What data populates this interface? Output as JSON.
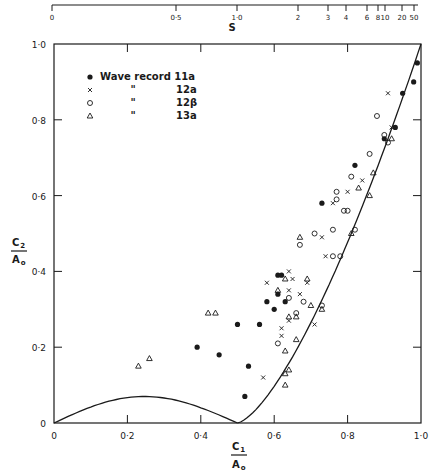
{
  "chart_data": {
    "type": "scatter",
    "title": "",
    "xlabel": "C1 / A0",
    "ylabel": "C2 / A0",
    "xlim": [
      0,
      1.0
    ],
    "ylim": [
      0,
      1.0
    ],
    "grid": false,
    "legend_position": "upper-left",
    "x_ticks": [
      "0",
      "0·2",
      "0·4",
      "0·6",
      "0·8",
      "1·0"
    ],
    "y_ticks": [
      "0",
      "0·2",
      "0·4",
      "0·6",
      "0·8",
      "1·0"
    ],
    "top_axis": {
      "label": "S",
      "ticks": [
        "0",
        "0·5",
        "1·0",
        "2",
        "3",
        "4",
        "6",
        "8",
        "10",
        "20",
        "50"
      ]
    },
    "series": [
      {
        "name": "Wave record 11a",
        "marker": "filled-circle",
        "points": [
          [
            0.39,
            0.2
          ],
          [
            0.45,
            0.18
          ],
          [
            0.5,
            0.26
          ],
          [
            0.56,
            0.26
          ],
          [
            0.53,
            0.15
          ],
          [
            0.52,
            0.07
          ],
          [
            0.58,
            0.32
          ],
          [
            0.63,
            0.32
          ],
          [
            0.6,
            0.3
          ],
          [
            0.61,
            0.39
          ],
          [
            0.62,
            0.39
          ],
          [
            0.61,
            0.34
          ],
          [
            0.73,
            0.58
          ],
          [
            0.82,
            0.68
          ],
          [
            0.9,
            0.75
          ],
          [
            0.93,
            0.78
          ],
          [
            0.95,
            0.87
          ],
          [
            0.98,
            0.9
          ],
          [
            0.99,
            0.95
          ]
        ]
      },
      {
        "name": "12a",
        "marker": "x",
        "points": [
          [
            0.58,
            0.37
          ],
          [
            0.57,
            0.12
          ],
          [
            0.64,
            0.4
          ],
          [
            0.65,
            0.38
          ],
          [
            0.64,
            0.35
          ],
          [
            0.67,
            0.34
          ],
          [
            0.64,
            0.27
          ],
          [
            0.62,
            0.25
          ],
          [
            0.62,
            0.23
          ],
          [
            0.71,
            0.26
          ],
          [
            0.69,
            0.37
          ],
          [
            0.74,
            0.44
          ],
          [
            0.73,
            0.49
          ],
          [
            0.76,
            0.58
          ],
          [
            0.8,
            0.61
          ],
          [
            0.84,
            0.64
          ],
          [
            0.92,
            0.78
          ],
          [
            0.91,
            0.87
          ]
        ]
      },
      {
        "name": "12β",
        "marker": "open-circle",
        "points": [
          [
            0.64,
            0.33
          ],
          [
            0.68,
            0.32
          ],
          [
            0.66,
            0.29
          ],
          [
            0.73,
            0.31
          ],
          [
            0.61,
            0.21
          ],
          [
            0.67,
            0.47
          ],
          [
            0.71,
            0.5
          ],
          [
            0.76,
            0.51
          ],
          [
            0.82,
            0.51
          ],
          [
            0.76,
            0.44
          ],
          [
            0.78,
            0.44
          ],
          [
            0.77,
            0.59
          ],
          [
            0.77,
            0.61
          ],
          [
            0.79,
            0.56
          ],
          [
            0.8,
            0.56
          ],
          [
            0.81,
            0.65
          ],
          [
            0.86,
            0.71
          ],
          [
            0.88,
            0.81
          ],
          [
            0.9,
            0.76
          ],
          [
            0.91,
            0.74
          ]
        ]
      },
      {
        "name": "13a",
        "marker": "open-triangle",
        "points": [
          [
            0.23,
            0.15
          ],
          [
            0.26,
            0.17
          ],
          [
            0.42,
            0.29
          ],
          [
            0.44,
            0.29
          ],
          [
            0.63,
            0.38
          ],
          [
            0.61,
            0.35
          ],
          [
            0.69,
            0.38
          ],
          [
            0.66,
            0.28
          ],
          [
            0.7,
            0.31
          ],
          [
            0.64,
            0.28
          ],
          [
            0.73,
            0.3
          ],
          [
            0.66,
            0.22
          ],
          [
            0.63,
            0.19
          ],
          [
            0.63,
            0.13
          ],
          [
            0.64,
            0.14
          ],
          [
            0.63,
            0.1
          ],
          [
            0.67,
            0.49
          ],
          [
            0.81,
            0.5
          ],
          [
            0.83,
            0.62
          ],
          [
            0.87,
            0.66
          ],
          [
            0.86,
            0.6
          ],
          [
            0.92,
            0.75
          ]
        ]
      }
    ],
    "curves": [
      {
        "name": "lower-arc",
        "description": "arc from (0,0) peaking ~0.07 at C1≈0.26 back to (0.5,0)"
      },
      {
        "name": "boundary-curve",
        "description": "curve rising from (0.5,0) to (1.0,1.0)"
      }
    ],
    "legend": {
      "entries": [
        {
          "symbol": "●",
          "ditto": "",
          "label": "Wave record 11a"
        },
        {
          "symbol": "x",
          "ditto": "\"",
          "label": "12a"
        },
        {
          "symbol": "○",
          "ditto": "\"",
          "label": "12β"
        },
        {
          "symbol": "△",
          "ditto": "\"",
          "label": "13a"
        }
      ]
    }
  },
  "labels": {
    "x_num": "C",
    "x_num_sub": "1",
    "x_den": "A",
    "x_den_sub": "o",
    "y_num": "C",
    "y_num_sub": "2",
    "y_den": "A",
    "y_den_sub": "o",
    "s_label": "S"
  }
}
